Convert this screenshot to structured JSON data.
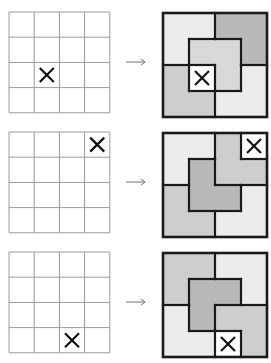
{
  "diagram": {
    "grid_size": 4,
    "mark_glyph": "X",
    "colors": {
      "background": "#ffffff",
      "grid_line": "#9a9a9a",
      "tile_border": "#1a1a1a",
      "mark": "#111111",
      "arrow": "#777777",
      "light": "#ececec",
      "medium_light": "#d9d9d9",
      "medium": "#cecece",
      "dark": "#b9b9b9"
    },
    "rows": [
      {
        "removed_cell": [
          2,
          1
        ],
        "tiles": [
          {
            "cells": [
              [
                0,
                0
              ],
              [
                0,
                1
              ],
              [
                1,
                0
              ]
            ],
            "shade": "light"
          },
          {
            "cells": [
              [
                0,
                2
              ],
              [
                0,
                3
              ],
              [
                1,
                3
              ]
            ],
            "shade": "dark"
          },
          {
            "cells": [
              [
                1,
                1
              ],
              [
                1,
                2
              ],
              [
                2,
                2
              ]
            ],
            "shade": "medium_light"
          },
          {
            "cells": [
              [
                2,
                0
              ],
              [
                3,
                0
              ],
              [
                3,
                1
              ]
            ],
            "shade": "medium"
          },
          {
            "cells": [
              [
                2,
                3
              ],
              [
                3,
                2
              ],
              [
                3,
                3
              ]
            ],
            "shade": "light"
          }
        ]
      },
      {
        "removed_cell": [
          0,
          3
        ],
        "tiles": [
          {
            "cells": [
              [
                0,
                0
              ],
              [
                0,
                1
              ],
              [
                1,
                0
              ]
            ],
            "shade": "light"
          },
          {
            "cells": [
              [
                0,
                2
              ],
              [
                1,
                2
              ],
              [
                1,
                3
              ]
            ],
            "shade": "medium"
          },
          {
            "cells": [
              [
                1,
                1
              ],
              [
                2,
                1
              ],
              [
                2,
                2
              ]
            ],
            "shade": "dark"
          },
          {
            "cells": [
              [
                2,
                0
              ],
              [
                3,
                0
              ],
              [
                3,
                1
              ]
            ],
            "shade": "medium"
          },
          {
            "cells": [
              [
                2,
                3
              ],
              [
                3,
                2
              ],
              [
                3,
                3
              ]
            ],
            "shade": "light"
          }
        ]
      },
      {
        "removed_cell": [
          3,
          2
        ],
        "tiles": [
          {
            "cells": [
              [
                0,
                0
              ],
              [
                0,
                1
              ],
              [
                1,
                0
              ]
            ],
            "shade": "medium"
          },
          {
            "cells": [
              [
                0,
                2
              ],
              [
                0,
                3
              ],
              [
                1,
                3
              ]
            ],
            "shade": "light"
          },
          {
            "cells": [
              [
                1,
                1
              ],
              [
                1,
                2
              ],
              [
                2,
                1
              ]
            ],
            "shade": "dark"
          },
          {
            "cells": [
              [
                2,
                0
              ],
              [
                3,
                0
              ],
              [
                3,
                1
              ]
            ],
            "shade": "light"
          },
          {
            "cells": [
              [
                2,
                2
              ],
              [
                2,
                3
              ],
              [
                3,
                3
              ]
            ],
            "shade": "medium"
          }
        ]
      }
    ]
  }
}
